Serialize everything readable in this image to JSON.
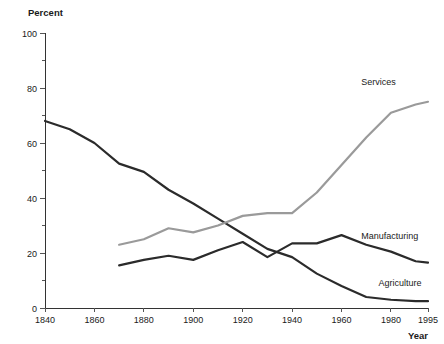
{
  "chart_data": {
    "type": "line",
    "title": "",
    "xlabel": "Year",
    "ylabel": "Percent",
    "xlim": [
      1840,
      1995
    ],
    "ylim": [
      0,
      100
    ],
    "grid": false,
    "legend_position": "inline-right-of-line-ends",
    "y_ticks": [
      0,
      20,
      40,
      60,
      80,
      100
    ],
    "y_tick_labels": [
      "0",
      "20",
      "40",
      "60",
      "80",
      "100"
    ],
    "y_minor_ticks": [
      10,
      30,
      50,
      70,
      90
    ],
    "x_ticks": [
      1840,
      1860,
      1880,
      1900,
      1920,
      1940,
      1960,
      1980,
      1995
    ],
    "x_tick_labels": [
      "1840",
      "1860",
      "1880",
      "1900",
      "1920",
      "1940",
      "1960",
      "1980",
      "1995"
    ],
    "series": [
      {
        "name": "Agriculture",
        "color": "#2b2b2b",
        "width": 2.2,
        "label_x": 1975,
        "label_y": 8,
        "x": [
          1840,
          1850,
          1860,
          1870,
          1880,
          1890,
          1900,
          1910,
          1920,
          1930,
          1940,
          1950,
          1960,
          1970,
          1980,
          1990,
          1995
        ],
        "values": [
          68,
          65,
          60,
          52.5,
          49.5,
          43,
          38,
          32.5,
          27,
          21.5,
          18.5,
          12.5,
          8,
          4,
          3,
          2.5,
          2.5
        ]
      },
      {
        "name": "Manufacturing",
        "color": "#2b2b2b",
        "width": 2.2,
        "label_x": 1968,
        "label_y": 25,
        "x": [
          1870,
          1880,
          1890,
          1900,
          1910,
          1920,
          1930,
          1940,
          1950,
          1960,
          1970,
          1980,
          1990,
          1995
        ],
        "values": [
          15.5,
          17.5,
          19,
          17.5,
          21,
          24,
          18.5,
          23.5,
          23.5,
          26.5,
          23,
          20.5,
          17,
          16.5
        ]
      },
      {
        "name": "Services",
        "color": "#9a9a9a",
        "width": 2.2,
        "label_x": 1968,
        "label_y": 81,
        "x": [
          1870,
          1880,
          1890,
          1900,
          1910,
          1920,
          1930,
          1940,
          1950,
          1960,
          1970,
          1980,
          1990,
          1995
        ],
        "values": [
          23,
          25,
          29,
          27.5,
          30,
          33.5,
          34.5,
          34.5,
          42,
          52,
          62,
          71,
          74,
          75
        ]
      }
    ]
  },
  "axis": {
    "y_title": "Percent",
    "x_title": "Year"
  }
}
